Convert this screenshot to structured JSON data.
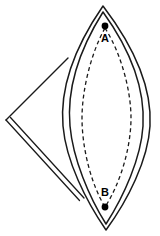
{
  "figure": {
    "type": "geometry-diagram",
    "background_color": "#ffffff",
    "stroke_color": "#1a1a1a",
    "marker_color": "#000000",
    "canvas": {
      "width": 160,
      "height": 236
    }
  },
  "labels": {
    "point_a": "A",
    "point_b": "B"
  },
  "points": [
    {
      "id": "A",
      "label": "A",
      "marker": "filled-dot",
      "x": 105,
      "y": 26,
      "label_x": 105,
      "label_y": 39
    },
    {
      "id": "B",
      "label": "B",
      "marker": "filled-dot",
      "x": 105,
      "y": 207,
      "label_x": 105,
      "label_y": 193
    }
  ],
  "shapes": {
    "outer_lens": {
      "name": "outer-lens-outline",
      "style": "solid",
      "apex_top": [
        103,
        6
      ],
      "apex_bottom": [
        106,
        230
      ],
      "left_extreme_x": 63,
      "right_extreme_x": 150
    },
    "inner_lens": {
      "name": "inner-lens-outline",
      "style": "solid",
      "apex_top": [
        103,
        12
      ],
      "apex_bottom": [
        106,
        224
      ],
      "left_extreme_x": 70,
      "right_extreme_x": 143
    },
    "dashed_ellipse": {
      "name": "dashed-inner-ellipse",
      "style": "dashed",
      "dash_pattern": "4 3",
      "top": [
        105,
        28
      ],
      "bottom": [
        105,
        207
      ],
      "left_extreme_x": 82,
      "right_extreme_x": 131
    },
    "triangle_flap": {
      "name": "triangle-flap",
      "vertex_left": [
        6,
        120
      ],
      "vertex_top_right": [
        68,
        58
      ],
      "vertex_bottom_right": [
        80,
        200
      ],
      "upper_edge_style": "single-line",
      "lower_edge_style": "double-line"
    }
  }
}
